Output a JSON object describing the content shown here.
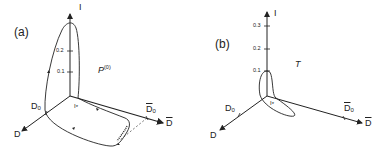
{
  "panels": [
    {
      "id": "a",
      "label": "(a)",
      "axes": {
        "vertical": "I",
        "left_diag": "D",
        "left_diag_marker": "D",
        "left_diag_marker_sub": "0",
        "right_diag": "D",
        "right_diag_marker": "D",
        "right_diag_marker_sub": "0",
        "origin_marker": "I",
        "origin_marker_sub": "*"
      },
      "ticks": [
        "0.1",
        "0.2"
      ],
      "curve_label": "P",
      "curve_label_sup": "(0)"
    },
    {
      "id": "b",
      "label": "(b)",
      "axes": {
        "vertical": "I",
        "left_diag": "D",
        "left_diag_marker": "D",
        "left_diag_marker_sub": "0",
        "right_diag": "D",
        "right_diag_marker": "D",
        "right_diag_marker_sub": "0",
        "origin_marker": "I",
        "origin_marker_sub": "*"
      },
      "ticks": [
        "0.1",
        "0.2",
        "0.3"
      ],
      "curve_label": "T"
    }
  ],
  "colors": {
    "ink": "#222222",
    "background": "#ffffff"
  }
}
